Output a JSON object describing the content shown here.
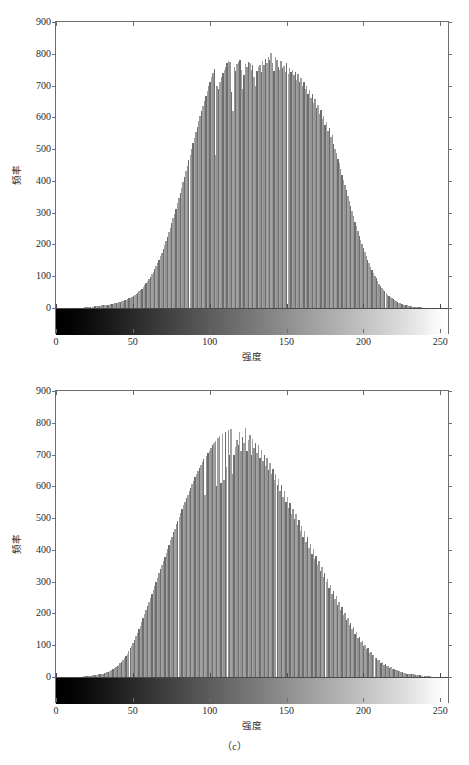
{
  "figure": {
    "caption": "（c）",
    "panels": [
      {
        "id": "a",
        "axis": {
          "xlabel": "强度",
          "ylabel": "频率",
          "xticks": [
            "0",
            "50",
            "100",
            "150",
            "200",
            "250"
          ],
          "yticks": [
            "0",
            "100",
            "200",
            "300",
            "400",
            "500",
            "600",
            "700",
            "800",
            "900"
          ]
        }
      },
      {
        "id": "b",
        "axis": {
          "xlabel": "强度",
          "ylabel": "频率",
          "xticks": [
            "0",
            "50",
            "100",
            "150",
            "200",
            "250"
          ],
          "yticks": [
            "0",
            "100",
            "200",
            "300",
            "400",
            "500",
            "600",
            "700",
            "800",
            "900"
          ]
        }
      }
    ]
  },
  "chart_data": [
    {
      "type": "bar",
      "title": "",
      "subtitle": "",
      "xlabel": "强度",
      "ylabel": "频率",
      "xlim": [
        0,
        255
      ],
      "ylim": [
        0,
        900
      ],
      "xticks": [
        0,
        50,
        100,
        150,
        200,
        250
      ],
      "yticks": [
        0,
        100,
        200,
        300,
        400,
        500,
        600,
        700,
        800,
        900
      ],
      "grid": false,
      "legend": null,
      "colorbar": {
        "type": "grayscale-strip",
        "from": "#000000",
        "to": "#ffffff",
        "position": "below-zero-axis"
      },
      "bar_color": "#9a9a9a",
      "note": "image-intensity histogram, 256 bins, values are counts per intensity level",
      "categories": [
        0,
        1,
        2,
        3,
        4,
        5,
        6,
        7,
        8,
        9,
        10,
        11,
        12,
        13,
        14,
        15,
        16,
        17,
        18,
        19,
        20,
        21,
        22,
        23,
        24,
        25,
        26,
        27,
        28,
        29,
        30,
        31,
        32,
        33,
        34,
        35,
        36,
        37,
        38,
        39,
        40,
        41,
        42,
        43,
        44,
        45,
        46,
        47,
        48,
        49,
        50,
        51,
        52,
        53,
        54,
        55,
        56,
        57,
        58,
        59,
        60,
        61,
        62,
        63,
        64,
        65,
        66,
        67,
        68,
        69,
        70,
        71,
        72,
        73,
        74,
        75,
        76,
        77,
        78,
        79,
        80,
        81,
        82,
        83,
        84,
        85,
        86,
        87,
        88,
        89,
        90,
        91,
        92,
        93,
        94,
        95,
        96,
        97,
        98,
        99,
        100,
        101,
        102,
        103,
        104,
        105,
        106,
        107,
        108,
        109,
        110,
        111,
        112,
        113,
        114,
        115,
        116,
        117,
        118,
        119,
        120,
        121,
        122,
        123,
        124,
        125,
        126,
        127,
        128,
        129,
        130,
        131,
        132,
        133,
        134,
        135,
        136,
        137,
        138,
        139,
        140,
        141,
        142,
        143,
        144,
        145,
        146,
        147,
        148,
        149,
        150,
        151,
        152,
        153,
        154,
        155,
        156,
        157,
        158,
        159,
        160,
        161,
        162,
        163,
        164,
        165,
        166,
        167,
        168,
        169,
        170,
        171,
        172,
        173,
        174,
        175,
        176,
        177,
        178,
        179,
        180,
        181,
        182,
        183,
        184,
        185,
        186,
        187,
        188,
        189,
        190,
        191,
        192,
        193,
        194,
        195,
        196,
        197,
        198,
        199,
        200,
        201,
        202,
        203,
        204,
        205,
        206,
        207,
        208,
        209,
        210,
        211,
        212,
        213,
        214,
        215,
        216,
        217,
        218,
        219,
        220,
        221,
        222,
        223,
        224,
        225,
        226,
        227,
        228,
        229,
        230,
        231,
        232,
        233,
        234,
        235,
        236,
        237,
        238,
        239,
        240,
        241,
        242,
        243,
        244,
        245,
        246,
        247,
        248,
        249,
        250,
        251,
        252,
        253,
        254,
        255
      ],
      "values": [
        0,
        0,
        0,
        0,
        0,
        0,
        0,
        0,
        0,
        0,
        0,
        0,
        0,
        0,
        0,
        0,
        0,
        1,
        1,
        1,
        2,
        2,
        2,
        3,
        3,
        4,
        4,
        5,
        5,
        6,
        6,
        7,
        8,
        8,
        9,
        10,
        10,
        11,
        12,
        13,
        14,
        15,
        16,
        17,
        18,
        20,
        21,
        23,
        24,
        26,
        28,
        30,
        33,
        35,
        38,
        41,
        45,
        48,
        52,
        57,
        61,
        66,
        72,
        78,
        84,
        91,
        98,
        106,
        114,
        123,
        132,
        142,
        152,
        163,
        174,
        186,
        198,
        211,
        224,
        238,
        252,
        267,
        282,
        297,
        313,
        329,
        345,
        362,
        379,
        396,
        413,
        430,
        448,
        465,
        483,
        500,
        518,
        535,
        553,
        570,
        587,
        604,
        620,
        637,
        653,
        668,
        683,
        698,
        712,
        726,
        739,
        752,
        481,
        700,
        690,
        712,
        726,
        738,
        749,
        760,
        770,
        778,
        773,
        680,
        620,
        759,
        745,
        768,
        775,
        781,
        749,
        690,
        732,
        768,
        758,
        775,
        770,
        749,
        764,
        727,
        700,
        745,
        759,
        766,
        744,
        776,
        766,
        785,
        770,
        791,
        780,
        803,
        772,
        745,
        790,
        779,
        760,
        748,
        776,
        755,
        762,
        744,
        770,
        735,
        755,
        742,
        750,
        733,
        744,
        716,
        736,
        712,
        725,
        700,
        712,
        688,
        700,
        675,
        687,
        660,
        672,
        645,
        658,
        630,
        640,
        612,
        622,
        594,
        604,
        576,
        586,
        558,
        566,
        538,
        546,
        517,
        500,
        488,
        470,
        455,
        437,
        420,
        404,
        387,
        370,
        353,
        336,
        320,
        304,
        288,
        272,
        257,
        242,
        228,
        214,
        200,
        188,
        175,
        163,
        152,
        141,
        130,
        120,
        110,
        101,
        93,
        85,
        77,
        70,
        64,
        58,
        52,
        47,
        42,
        38,
        34,
        30,
        27,
        24,
        21,
        19,
        17,
        15,
        13,
        11,
        10,
        9,
        8,
        7,
        6,
        5,
        4,
        4,
        3,
        3,
        2,
        2,
        2,
        1,
        1,
        1,
        1,
        0,
        0,
        0,
        0,
        0,
        0,
        0,
        0,
        0,
        0,
        0,
        0,
        0,
        0
      ]
    },
    {
      "type": "bar",
      "title": "",
      "subtitle": "",
      "xlabel": "强度",
      "ylabel": "频率",
      "xlim": [
        0,
        255
      ],
      "ylim": [
        0,
        900
      ],
      "xticks": [
        0,
        50,
        100,
        150,
        200,
        250
      ],
      "yticks": [
        0,
        100,
        200,
        300,
        400,
        500,
        600,
        700,
        800,
        900
      ],
      "grid": false,
      "legend": null,
      "colorbar": {
        "type": "grayscale-strip",
        "from": "#000000",
        "to": "#ffffff",
        "position": "below-zero-axis"
      },
      "bar_color": "#9a9a9a",
      "note": "image-intensity histogram, 256 bins, values are counts per intensity level",
      "categories": [
        0,
        1,
        2,
        3,
        4,
        5,
        6,
        7,
        8,
        9,
        10,
        11,
        12,
        13,
        14,
        15,
        16,
        17,
        18,
        19,
        20,
        21,
        22,
        23,
        24,
        25,
        26,
        27,
        28,
        29,
        30,
        31,
        32,
        33,
        34,
        35,
        36,
        37,
        38,
        39,
        40,
        41,
        42,
        43,
        44,
        45,
        46,
        47,
        48,
        49,
        50,
        51,
        52,
        53,
        54,
        55,
        56,
        57,
        58,
        59,
        60,
        61,
        62,
        63,
        64,
        65,
        66,
        67,
        68,
        69,
        70,
        71,
        72,
        73,
        74,
        75,
        76,
        77,
        78,
        79,
        80,
        81,
        82,
        83,
        84,
        85,
        86,
        87,
        88,
        89,
        90,
        91,
        92,
        93,
        94,
        95,
        96,
        97,
        98,
        99,
        100,
        101,
        102,
        103,
        104,
        105,
        106,
        107,
        108,
        109,
        110,
        111,
        112,
        113,
        114,
        115,
        116,
        117,
        118,
        119,
        120,
        121,
        122,
        123,
        124,
        125,
        126,
        127,
        128,
        129,
        130,
        131,
        132,
        133,
        134,
        135,
        136,
        137,
        138,
        139,
        140,
        141,
        142,
        143,
        144,
        145,
        146,
        147,
        148,
        149,
        150,
        151,
        152,
        153,
        154,
        155,
        156,
        157,
        158,
        159,
        160,
        161,
        162,
        163,
        164,
        165,
        166,
        167,
        168,
        169,
        170,
        171,
        172,
        173,
        174,
        175,
        176,
        177,
        178,
        179,
        180,
        181,
        182,
        183,
        184,
        185,
        186,
        187,
        188,
        189,
        190,
        191,
        192,
        193,
        194,
        195,
        196,
        197,
        198,
        199,
        200,
        201,
        202,
        203,
        204,
        205,
        206,
        207,
        208,
        209,
        210,
        211,
        212,
        213,
        214,
        215,
        216,
        217,
        218,
        219,
        220,
        221,
        222,
        223,
        224,
        225,
        226,
        227,
        228,
        229,
        230,
        231,
        232,
        233,
        234,
        235,
        236,
        237,
        238,
        239,
        240,
        241,
        242,
        243,
        244,
        245,
        246,
        247,
        248,
        249,
        250,
        251,
        252,
        253,
        254,
        255
      ],
      "values": [
        0,
        0,
        0,
        0,
        0,
        0,
        0,
        0,
        0,
        0,
        0,
        0,
        0,
        0,
        0,
        0,
        1,
        1,
        1,
        2,
        2,
        3,
        3,
        4,
        4,
        5,
        6,
        6,
        7,
        8,
        9,
        10,
        11,
        12,
        14,
        15,
        17,
        19,
        21,
        24,
        27,
        30,
        34,
        38,
        43,
        48,
        54,
        60,
        67,
        74,
        82,
        90,
        99,
        108,
        118,
        128,
        139,
        150,
        161,
        173,
        185,
        197,
        210,
        222,
        235,
        248,
        261,
        274,
        287,
        300,
        313,
        326,
        339,
        352,
        365,
        378,
        391,
        404,
        417,
        430,
        442,
        455,
        467,
        480,
        492,
        504,
        516,
        528,
        540,
        551,
        563,
        574,
        585,
        596,
        607,
        617,
        628,
        638,
        648,
        658,
        668,
        677,
        686,
        572,
        695,
        704,
        712,
        721,
        729,
        736,
        744,
        600,
        751,
        758,
        612,
        764,
        620,
        770,
        660,
        776,
        700,
        782,
        640,
        700,
        725,
        745,
        730,
        770,
        710,
        755,
        735,
        783,
        712,
        745,
        762,
        700,
        748,
        720,
        735,
        705,
        730,
        690,
        715,
        680,
        700,
        665,
        688,
        652,
        672,
        638,
        655,
        620,
        640,
        604,
        622,
        586,
        604,
        568,
        586,
        550,
        568,
        532,
        548,
        514,
        530,
        496,
        512,
        478,
        494,
        460,
        476,
        442,
        458,
        424,
        440,
        406,
        420,
        388,
        402,
        370,
        382,
        352,
        364,
        334,
        345,
        316,
        327,
        298,
        308,
        280,
        290,
        262,
        272,
        245,
        254,
        228,
        236,
        212,
        219,
        196,
        203,
        180,
        187,
        165,
        171,
        150,
        156,
        136,
        141,
        123,
        127,
        110,
        114,
        98,
        102,
        87,
        90,
        77,
        80,
        68,
        70,
        59,
        61,
        52,
        54,
        45,
        47,
        39,
        40,
        34,
        35,
        29,
        30,
        25,
        26,
        21,
        22,
        18,
        19,
        15,
        16,
        13,
        13,
        11,
        11,
        9,
        9,
        8,
        8,
        6,
        6,
        5,
        5,
        4,
        4,
        3,
        3,
        2,
        2,
        2,
        1,
        1,
        1,
        1,
        1,
        0,
        0,
        0,
        0,
        0,
        0,
        0
      ]
    }
  ]
}
